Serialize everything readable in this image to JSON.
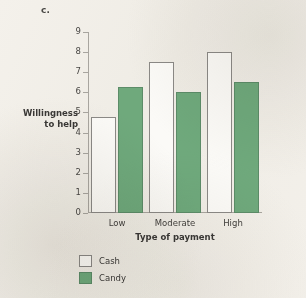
{
  "figure": {
    "panel_label": "c.",
    "background_color": "#f2efe9"
  },
  "chart_data": {
    "type": "bar",
    "title": "",
    "categories": [
      "Low",
      "Moderate",
      "High"
    ],
    "series": [
      {
        "name": "Cash",
        "values": [
          4.75,
          7.5,
          8.0
        ],
        "color": "#ffffff",
        "border_color": "#8b8986"
      },
      {
        "name": "Candy",
        "values": [
          6.25,
          6.0,
          6.5
        ],
        "color": "#6fa97c",
        "border_color": "#5c8c68"
      }
    ],
    "xlabel": "Type of payment",
    "ylabel": "Willingness to help",
    "ylabel_lines": [
      "Willingness",
      "to help"
    ],
    "ylim": [
      0,
      9
    ],
    "ytick_labels": [
      "0",
      "1",
      "2",
      "3",
      "4",
      "5",
      "6",
      "7",
      "8",
      "9"
    ],
    "ytick_values": [
      0,
      1,
      2,
      3,
      4,
      5,
      6,
      7,
      8,
      9
    ],
    "grid": false,
    "legend_position": "below-left",
    "legend_entries": [
      "Cash",
      "Candy"
    ]
  }
}
